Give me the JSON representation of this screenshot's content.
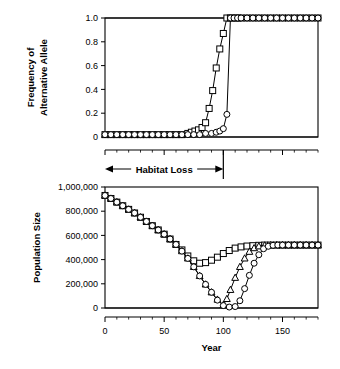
{
  "figure": {
    "name": "two-panel-population-genetics-figure",
    "width": 340,
    "height": 369
  },
  "chart_data": [
    {
      "type": "line",
      "panel": "top",
      "title": "",
      "xlabel": "",
      "ylabel": "Frequency of Alternative Allele",
      "ylabel_lines": [
        "Frequency of",
        "Alternative Allele"
      ],
      "xlim": [
        0,
        180
      ],
      "ylim": [
        0,
        1.0
      ],
      "xticks": [
        0,
        50,
        100,
        150
      ],
      "xticklabels": [
        "",
        "",
        "",
        ""
      ],
      "yticks": [
        0,
        0.2,
        0.4,
        0.6,
        0.8,
        1.0
      ],
      "yticklabels": [
        "0",
        "0.2",
        "0.4",
        "0.6",
        "0.8",
        "1.0"
      ],
      "minor_x_interval": 10,
      "grid": false,
      "legend": null,
      "annotations": [
        {
          "text": "Habitat Loss",
          "type": "double-arrow-span",
          "x_start": 0,
          "x_end": 100
        },
        {
          "text": "",
          "type": "vertical-line",
          "x": 100
        }
      ],
      "series": [
        {
          "name": "square-series",
          "marker": "square",
          "x": [
            0,
            5,
            10,
            15,
            20,
            25,
            30,
            35,
            40,
            45,
            50,
            55,
            60,
            65,
            70,
            73,
            76,
            79,
            82,
            85,
            88,
            91,
            94,
            97,
            100,
            103,
            106,
            109,
            112,
            115,
            120,
            125,
            130,
            135,
            140,
            145,
            150,
            155,
            160,
            165,
            170,
            175,
            180
          ],
          "y": [
            0.02,
            0.02,
            0.02,
            0.02,
            0.02,
            0.02,
            0.02,
            0.02,
            0.02,
            0.02,
            0.02,
            0.02,
            0.02,
            0.02,
            0.03,
            0.04,
            0.05,
            0.06,
            0.08,
            0.12,
            0.24,
            0.39,
            0.58,
            0.74,
            0.87,
            1.0,
            1.0,
            1.0,
            1.0,
            1.0,
            1.0,
            1.0,
            1.0,
            1.0,
            1.0,
            1.0,
            1.0,
            1.0,
            1.0,
            1.0,
            1.0,
            1.0,
            1.0
          ]
        },
        {
          "name": "circle-series",
          "marker": "circle",
          "x": [
            0,
            5,
            10,
            15,
            20,
            25,
            30,
            35,
            40,
            45,
            50,
            55,
            60,
            65,
            70,
            75,
            80,
            85,
            90,
            94,
            97,
            100,
            103,
            106,
            109,
            112,
            115,
            120,
            125,
            130,
            135,
            140,
            145,
            150,
            155,
            160,
            165,
            170,
            175,
            180
          ],
          "y": [
            0.02,
            0.02,
            0.02,
            0.02,
            0.02,
            0.02,
            0.02,
            0.02,
            0.02,
            0.02,
            0.02,
            0.02,
            0.02,
            0.02,
            0.02,
            0.02,
            0.02,
            0.03,
            0.03,
            0.04,
            0.05,
            0.07,
            0.19,
            1.0,
            1.0,
            1.0,
            1.0,
            1.0,
            1.0,
            1.0,
            1.0,
            1.0,
            1.0,
            1.0,
            1.0,
            1.0,
            1.0,
            1.0,
            1.0,
            1.0
          ]
        }
      ]
    },
    {
      "type": "line",
      "panel": "bottom",
      "title": "",
      "xlabel": "Year",
      "ylabel": "Population Size",
      "xlim": [
        0,
        180
      ],
      "ylim": [
        0,
        1000000
      ],
      "xticks": [
        0,
        50,
        100,
        150
      ],
      "xticklabels": [
        "0",
        "50",
        "100",
        "150"
      ],
      "yticks": [
        0,
        200000,
        400000,
        600000,
        800000,
        1000000
      ],
      "yticklabels": [
        "0",
        "200,000",
        "400,000",
        "600,000",
        "800,000",
        "1,000,000"
      ],
      "minor_x_interval": 10,
      "grid": false,
      "legend": null,
      "series": [
        {
          "name": "square-series",
          "marker": "square",
          "x": [
            0,
            5,
            10,
            15,
            20,
            25,
            30,
            35,
            40,
            45,
            50,
            55,
            60,
            65,
            70,
            75,
            80,
            85,
            90,
            95,
            100,
            105,
            110,
            115,
            120,
            125,
            130,
            135,
            140,
            145,
            150,
            155,
            160,
            165,
            170,
            175,
            180
          ],
          "y": [
            930000,
            905000,
            875000,
            845000,
            815000,
            785000,
            750000,
            715000,
            680000,
            645000,
            610000,
            570000,
            525000,
            480000,
            430000,
            390000,
            370000,
            375000,
            395000,
            420000,
            450000,
            475000,
            495000,
            505000,
            512000,
            515000,
            518000,
            520000,
            520000,
            520000,
            520000,
            520000,
            520000,
            520000,
            520000,
            520000,
            520000
          ]
        },
        {
          "name": "triangle-series",
          "marker": "triangle",
          "x": [
            0,
            5,
            10,
            15,
            20,
            25,
            30,
            35,
            40,
            45,
            50,
            55,
            60,
            65,
            70,
            75,
            80,
            85,
            90,
            95,
            100,
            103,
            106,
            110,
            114,
            118,
            122,
            126,
            130,
            135,
            140,
            145,
            150,
            155,
            160,
            165,
            170,
            175,
            180
          ],
          "y": [
            930000,
            905000,
            875000,
            845000,
            815000,
            785000,
            750000,
            715000,
            680000,
            645000,
            610000,
            570000,
            525000,
            470000,
            410000,
            340000,
            265000,
            195000,
            130000,
            70000,
            25000,
            75000,
            150000,
            250000,
            340000,
            410000,
            465000,
            495000,
            510000,
            518000,
            520000,
            520000,
            520000,
            520000,
            520000,
            520000,
            520000,
            520000,
            520000
          ]
        },
        {
          "name": "circle-series",
          "marker": "circle",
          "x": [
            0,
            5,
            10,
            15,
            20,
            25,
            30,
            35,
            40,
            45,
            50,
            55,
            60,
            65,
            70,
            75,
            80,
            85,
            90,
            95,
            100,
            105,
            110,
            114,
            118,
            122,
            126,
            130,
            134,
            138,
            142,
            146,
            150,
            155,
            160,
            165,
            170,
            175,
            180
          ],
          "y": [
            930000,
            905000,
            875000,
            845000,
            815000,
            785000,
            750000,
            715000,
            680000,
            645000,
            610000,
            570000,
            525000,
            470000,
            410000,
            340000,
            265000,
            195000,
            130000,
            65000,
            20000,
            8000,
            12000,
            60000,
            160000,
            270000,
            370000,
            440000,
            490000,
            510000,
            518000,
            520000,
            520000,
            520000,
            520000,
            520000,
            520000,
            520000,
            520000
          ]
        }
      ]
    }
  ]
}
